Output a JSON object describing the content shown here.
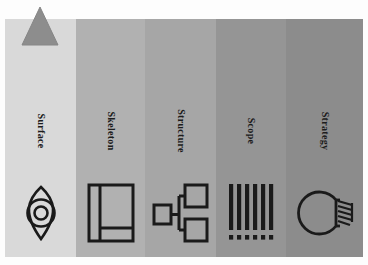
{
  "figure": {
    "title": "",
    "background_color": "#fdfdfd",
    "panel": {
      "x": 5,
      "y": 19,
      "width": 358,
      "height": 238
    },
    "marker": {
      "name": "triangle-marker",
      "shape": "triangle",
      "fill_color": "#8d8d8d",
      "stroke_color": "#7a7a7a"
    },
    "bands": [
      {
        "label": "Surface",
        "background_color": "#d9d9d9",
        "width_px": 71,
        "icon": "eye-icon",
        "icon_color": "#1a1a1a"
      },
      {
        "label": "Skeleton",
        "background_color": "#b1b1b1",
        "width_px": 69,
        "icon": "wireframe-layout-icon",
        "icon_color": "#1a1a1a"
      },
      {
        "label": "Structure",
        "background_color": "#a6a6a6",
        "width_px": 71,
        "icon": "sitemap-icon",
        "icon_color": "#1a1a1a"
      },
      {
        "label": "Scope",
        "background_color": "#959595",
        "width_px": 70,
        "icon": "barcode-icon",
        "icon_color": "#1a1a1a"
      },
      {
        "label": "Strategy",
        "background_color": "#8c8c8c",
        "width_px": 77,
        "icon": "lightbulb-icon",
        "icon_color": "#1a1a1a"
      }
    ]
  }
}
